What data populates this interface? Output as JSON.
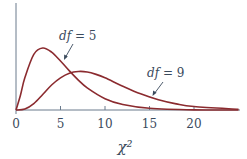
{
  "chart_data": {
    "type": "line",
    "title": "",
    "xlabel": "χ²",
    "ylabel": "",
    "xlim": [
      0,
      25
    ],
    "grid": false,
    "x_ticks": [
      "0",
      "5",
      "10",
      "15",
      "20"
    ],
    "x_tick_values": [
      0,
      5,
      10,
      15,
      20
    ],
    "y_ticks": [],
    "series": [
      {
        "name": "df = 5",
        "x": [
          0,
          0.5,
          1,
          2,
          3,
          4,
          5,
          6,
          7,
          8,
          10,
          12,
          15,
          20,
          25
        ],
        "values": [
          0,
          0.0367,
          0.0807,
          0.1384,
          0.1542,
          0.144,
          0.122,
          0.0973,
          0.0745,
          0.0551,
          0.0282,
          0.0137,
          0.0044,
          0.0004,
          0.0
        ]
      },
      {
        "name": "df = 9",
        "x": [
          0,
          1,
          2,
          3,
          4,
          5,
          6,
          7,
          8,
          9,
          10,
          12,
          14,
          16,
          18,
          20,
          25
        ],
        "values": [
          0,
          0.0023,
          0.0158,
          0.0385,
          0.0623,
          0.0801,
          0.0916,
          0.0958,
          0.0946,
          0.0886,
          0.08,
          0.0593,
          0.0403,
          0.0255,
          0.0153,
          0.0087,
          0.0018
        ]
      }
    ],
    "annotations": [
      {
        "text_var": "df",
        "text_rest": " = 5",
        "points_to": "df = 5 curve"
      },
      {
        "text_var": "df",
        "text_rest": " = 9",
        "points_to": "df = 9 curve"
      }
    ],
    "colors": {
      "curve": "#8b2b2f",
      "axis": "#6a7a8c",
      "text": "#3a4a5c"
    }
  }
}
